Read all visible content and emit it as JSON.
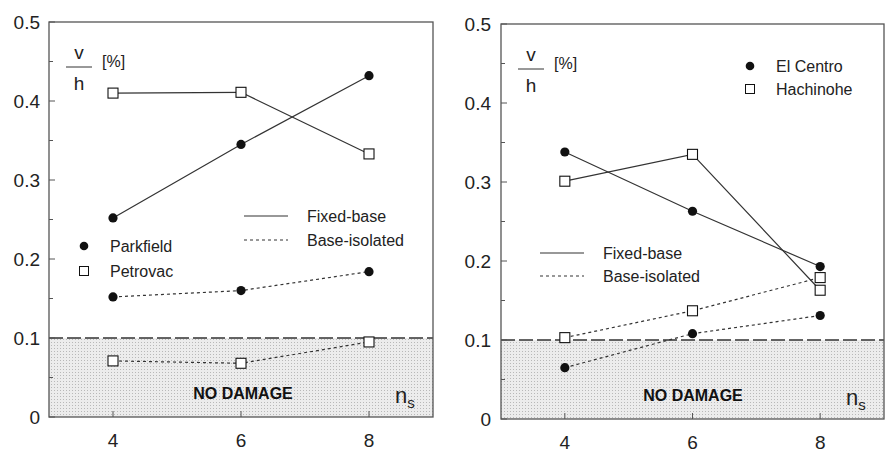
{
  "chart_data": [
    {
      "type": "line",
      "panel": "left",
      "title": "",
      "xlabel": "n_s",
      "ylabel": "v/h [%]",
      "x": [
        4,
        6,
        8
      ],
      "xticks": [
        "4",
        "6",
        "8"
      ],
      "yticks": [
        "0",
        "0.1",
        "0.2",
        "0.3",
        "0.4",
        "0.5"
      ],
      "xlim": [
        3,
        9
      ],
      "ylim": [
        0,
        0.5
      ],
      "grid": false,
      "series": [
        {
          "name": "Parkfield",
          "condition": "Fixed-base",
          "marker": "filled-circle",
          "linestyle": "solid",
          "values": [
            0.252,
            0.345,
            0.432
          ]
        },
        {
          "name": "Petrovac",
          "condition": "Fixed-base",
          "marker": "open-square",
          "linestyle": "solid",
          "values": [
            0.41,
            0.411,
            0.333
          ]
        },
        {
          "name": "Parkfield",
          "condition": "Base-isolated",
          "marker": "filled-circle",
          "linestyle": "dotted",
          "values": [
            0.152,
            0.16,
            0.184
          ]
        },
        {
          "name": "Petrovac",
          "condition": "Base-isolated",
          "marker": "open-square",
          "linestyle": "dotted",
          "values": [
            0.071,
            0.068,
            0.095
          ]
        }
      ],
      "threshold": {
        "value": 0.1,
        "label": "NO DAMAGE",
        "style": "dashed",
        "shaded_below": true
      },
      "legend": {
        "markers": [
          {
            "symbol": "filled-circle",
            "label": "Parkfield"
          },
          {
            "symbol": "open-square",
            "label": "Petrovac"
          }
        ],
        "lines": [
          {
            "style": "solid",
            "label": "Fixed-base"
          },
          {
            "style": "dotted",
            "label": "Base-isolated"
          }
        ]
      }
    },
    {
      "type": "line",
      "panel": "right",
      "title": "",
      "xlabel": "n_s",
      "ylabel": "v/h [%]",
      "x": [
        4,
        6,
        8
      ],
      "xticks": [
        "4",
        "6",
        "8"
      ],
      "yticks": [
        "0",
        "0.1",
        "0.2",
        "0.3",
        "0.4",
        "0.5"
      ],
      "xlim": [
        3,
        9
      ],
      "ylim": [
        0,
        0.5
      ],
      "grid": false,
      "series": [
        {
          "name": "El Centro",
          "condition": "Fixed-base",
          "marker": "filled-circle",
          "linestyle": "solid",
          "values": [
            0.338,
            0.263,
            0.193
          ]
        },
        {
          "name": "Hachinohe",
          "condition": "Fixed-base",
          "marker": "open-square",
          "linestyle": "solid",
          "values": [
            0.301,
            0.335,
            0.163
          ]
        },
        {
          "name": "Hachinohe",
          "condition": "Base-isolated",
          "marker": "open-square",
          "linestyle": "dotted",
          "values": [
            0.103,
            0.137,
            0.179
          ]
        },
        {
          "name": "El Centro",
          "condition": "Base-isolated",
          "marker": "filled-circle",
          "linestyle": "dotted",
          "values": [
            0.065,
            0.108,
            0.131
          ]
        }
      ],
      "threshold": {
        "value": 0.1,
        "label": "NO DAMAGE",
        "style": "dashed",
        "shaded_below": true
      },
      "legend": {
        "markers": [
          {
            "symbol": "filled-circle",
            "label": "El Centro"
          },
          {
            "symbol": "open-square",
            "label": "Hachinohe"
          }
        ],
        "lines": [
          {
            "style": "solid",
            "label": "Fixed-base"
          },
          {
            "style": "dotted",
            "label": "Base-isolated"
          }
        ]
      }
    }
  ],
  "labels": {
    "ylabel_num": "v",
    "ylabel_den": "h",
    "ylabel_unit": "[%]",
    "no_damage": "NO DAMAGE",
    "xaxis_var": "n",
    "xaxis_sub": "s",
    "fixed": "Fixed-base",
    "isolated": "Base-isolated"
  },
  "colors": {
    "line": "#333333",
    "marker": "#111111",
    "shade": "#e4e4e4",
    "frame": "#555555"
  }
}
